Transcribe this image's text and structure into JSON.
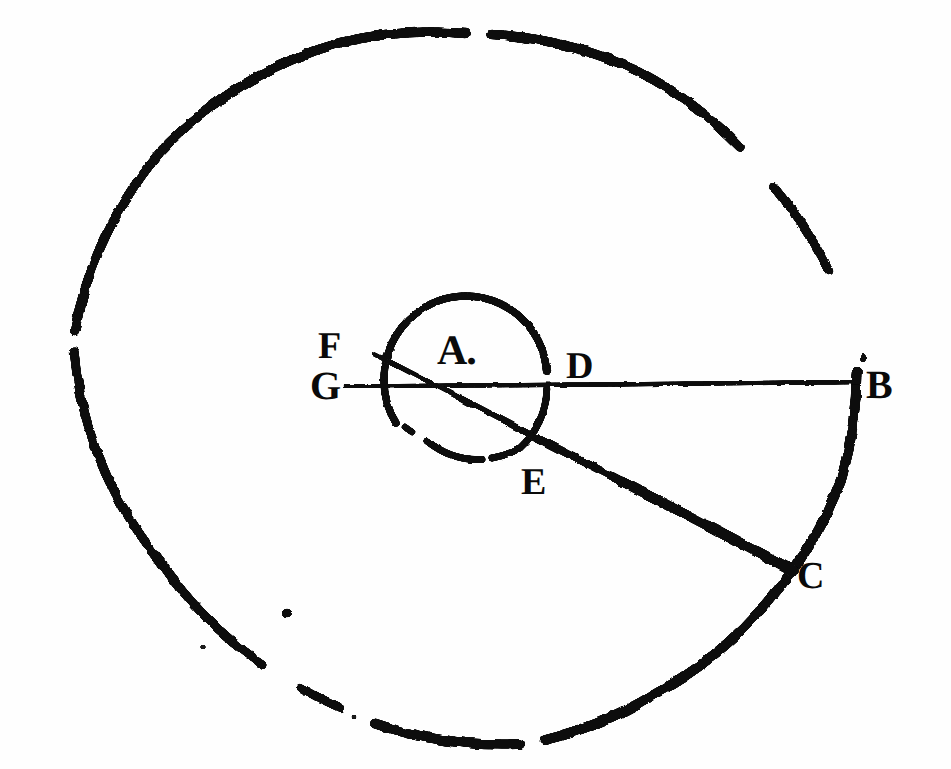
{
  "figure": {
    "kind": "geometric-diagram",
    "style": "antique-engraving",
    "background_color": "#fefefe",
    "ink_color": "#111111",
    "width": 951,
    "height": 769,
    "labels": {
      "A": "A.",
      "B": "B",
      "C": "C",
      "D": "D",
      "E": "E",
      "F": "F",
      "G": "G"
    },
    "geometry": {
      "center": {
        "x": 465,
        "y": 378
      },
      "outer_circle": {
        "name": "outer-circle",
        "cx": 465,
        "cy": 378,
        "r": 392,
        "stroke_width": 9,
        "gaps_deg": [
          [
            266,
            274
          ],
          [
            300,
            318
          ],
          [
            196,
            203
          ],
          [
            76,
            84
          ],
          [
            96,
            101
          ]
        ]
      },
      "inner_circle": {
        "name": "inner-circle",
        "cx": 465,
        "cy": 378,
        "r": 82,
        "stroke_width": 7,
        "gaps_deg": [
          [
            118,
            134
          ],
          [
            4,
            12
          ]
        ]
      },
      "horizontal_line": {
        "name": "line-GB",
        "from": {
          "label": "G",
          "x": 345,
          "y": 386
        },
        "to": {
          "label": "B",
          "x": 858,
          "y": 382
        },
        "stroke_width": 4
      },
      "diagonal_line": {
        "name": "line-FC",
        "from": {
          "label": "F",
          "x": 374,
          "y": 354
        },
        "to": {
          "label": "C",
          "x": 793,
          "y": 571
        },
        "stroke_width_start": 5,
        "stroke_width_end": 12
      },
      "ink_speck": {
        "x": 287,
        "y": 613,
        "r": 4
      }
    }
  }
}
